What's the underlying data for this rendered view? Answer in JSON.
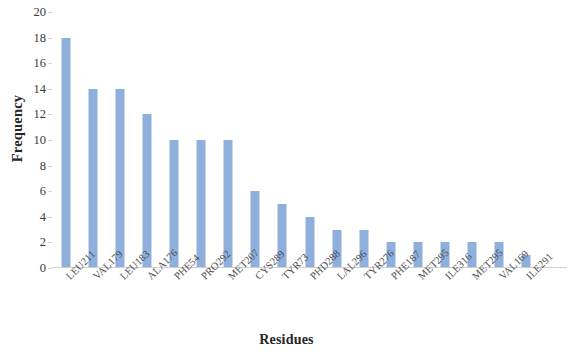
{
  "chart_data": {
    "type": "bar",
    "title": "",
    "xlabel": "Residues",
    "ylabel": "Frequency",
    "categories": [
      "LEU211",
      "VAL179",
      "LEU183",
      "ALA176",
      "PHE54",
      "PRO292",
      "MET207",
      "CYS289",
      "TYR73",
      "PHD288",
      "LAL296",
      "TYR276",
      "PHE187",
      "MET295",
      "ILE316",
      "MET295",
      "VAL169",
      "ILE291"
    ],
    "values": [
      18,
      14,
      14,
      12,
      10,
      10,
      10,
      6,
      5,
      4,
      3,
      3,
      2,
      2,
      2,
      2,
      2,
      1
    ],
    "ylim": [
      0,
      20
    ],
    "ytick_labels": [
      "0",
      "2",
      "4",
      "6",
      "8",
      "10",
      "12",
      "14",
      "16",
      "18",
      "20"
    ],
    "ytick_values": [
      0,
      2,
      4,
      6,
      8,
      10,
      12,
      14,
      16,
      18,
      20
    ],
    "ytick_step": 2,
    "grid": false,
    "legend": null,
    "bar_color": "#8FB0DD",
    "axis_color": "#CFCFCF",
    "text_color": "#3A3A3A",
    "background": "#FFFFFF",
    "xtick_rotation": -45
  }
}
